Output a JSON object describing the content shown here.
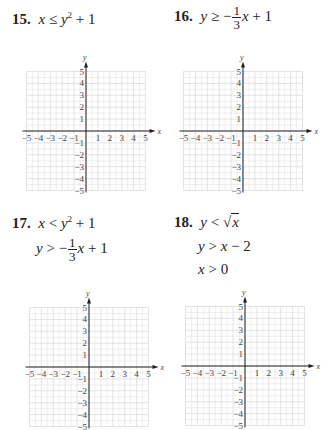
{
  "problems": [
    {
      "number": "15.",
      "lines": [
        {
          "lhs": "x",
          "op": "≤",
          "rhs": "y",
          "sup": "2",
          "rest": "+ 1"
        }
      ]
    },
    {
      "number": "16.",
      "lines": [
        {
          "lhs": "y",
          "op": "≥",
          "sign": "−",
          "num": "1",
          "den": "3",
          "rhs": "x",
          "rest": "+ 1"
        }
      ]
    },
    {
      "number": "17.",
      "lines": [
        {
          "lhs": "x",
          "op": "<",
          "rhs": "y",
          "sup": "2",
          "rest": "+ 1"
        },
        {
          "lhs": "y",
          "op": ">",
          "sign": "−",
          "num": "1",
          "den": "3",
          "rhs": "x",
          "rest": "+ 1"
        }
      ]
    },
    {
      "number": "18.",
      "lines": [
        {
          "lhs": "y",
          "op": "<",
          "sqrt": "√",
          "rhs": "x"
        },
        {
          "lhs": "y",
          "op": ">",
          "rhs": "x",
          "rest": "− 2"
        },
        {
          "lhs": "x",
          "op": ">",
          "rest": "0"
        }
      ]
    }
  ],
  "axes": {
    "x_label": "x",
    "y_label": "y",
    "x_ticks": [
      "−5",
      "−4",
      "−3",
      "−2",
      "−1",
      "1",
      "2",
      "3",
      "4",
      "5"
    ],
    "y_ticks_pos": [
      "5",
      "4",
      "3",
      "2",
      "1"
    ],
    "y_ticks_neg": [
      "−1",
      "−2",
      "−3",
      "−4",
      "−5"
    ],
    "grid_color": "#d9d9d9",
    "axis_color": "#231f20"
  },
  "chart_data": [
    {
      "type": "blank-coordinate-grid",
      "problem": "15",
      "xlim": [
        -5,
        5
      ],
      "ylim": [
        -5,
        5
      ],
      "grid": true,
      "minor_step": 0.5,
      "xlabel": "x",
      "ylabel": "y"
    },
    {
      "type": "blank-coordinate-grid",
      "problem": "16",
      "xlim": [
        -5,
        5
      ],
      "ylim": [
        -5,
        5
      ],
      "grid": true,
      "minor_step": 0.5,
      "xlabel": "x",
      "ylabel": "y"
    },
    {
      "type": "blank-coordinate-grid",
      "problem": "17",
      "xlim": [
        -5,
        5
      ],
      "ylim": [
        -5,
        5
      ],
      "grid": true,
      "minor_step": 0.5,
      "xlabel": "x",
      "ylabel": "y"
    },
    {
      "type": "blank-coordinate-grid",
      "problem": "18",
      "xlim": [
        -5,
        5
      ],
      "ylim": [
        -5,
        5
      ],
      "grid": true,
      "minor_step": 0.5,
      "xlabel": "x",
      "ylabel": "y"
    }
  ]
}
